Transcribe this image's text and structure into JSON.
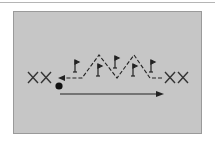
{
  "diagram": {
    "type": "drill-diagram",
    "colors": {
      "background": "#ffffff",
      "panel": "#c6c6c6",
      "panel_border": "#9a9a9a",
      "ink": "#222222",
      "top_rule": "#b5b5b5"
    },
    "left_group": {
      "label": "XX"
    },
    "right_group": {
      "label": "XX"
    },
    "ball": {
      "cx": 59,
      "cy": 86,
      "r": 3.6
    },
    "pass_arrow": {
      "x1": 60,
      "y1": 94,
      "x2": 163,
      "y2": 94,
      "direction": "right"
    },
    "dribble_path": {
      "style": "dashed",
      "points": [
        [
          162,
          78
        ],
        [
          150,
          78
        ],
        [
          134,
          55
        ],
        [
          117,
          78
        ],
        [
          99,
          55
        ],
        [
          82,
          78
        ],
        [
          62,
          78
        ]
      ],
      "direction": "left"
    },
    "flags": [
      {
        "x": 75,
        "top": 60,
        "bottom": 72
      },
      {
        "x": 98,
        "top": 64,
        "bottom": 76
      },
      {
        "x": 115,
        "top": 56,
        "bottom": 68
      },
      {
        "x": 133,
        "top": 64,
        "bottom": 76
      },
      {
        "x": 151,
        "top": 60,
        "bottom": 72
      }
    ]
  }
}
